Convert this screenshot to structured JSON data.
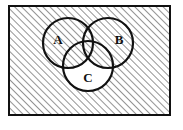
{
  "figure": {
    "kind": "venn-diagram",
    "title": "",
    "set_count": 3,
    "shading_description": "universal-set-and-intersections-hatched",
    "colors": {
      "page_background": "#ffffff",
      "frame_stroke": "#111111",
      "circle_stroke": "#111111",
      "hatch_stroke": "#3a3a3a",
      "label_text": "#111111",
      "circle_fill": "#ffffff"
    }
  },
  "frame": {
    "name": "universal-set-rectangle",
    "x": 9,
    "y": 6,
    "width": 161,
    "height": 109,
    "stroke_width": 2,
    "hatched": true
  },
  "hatch": {
    "angle_degrees": 45,
    "spacing_px": 5,
    "stroke_width": 1.1
  },
  "sets": [
    {
      "id": "A",
      "label": "A",
      "cx": 68,
      "cy": 43,
      "r": 25,
      "label_x": 58,
      "label_y": 41,
      "shaded": false
    },
    {
      "id": "B",
      "label": "B",
      "cx": 108,
      "cy": 43,
      "r": 25,
      "label_x": 119,
      "label_y": 41,
      "shaded": false
    },
    {
      "id": "C",
      "label": "C",
      "cx": 88,
      "cy": 66,
      "r": 25,
      "label_x": 88,
      "label_y": 79,
      "shaded": false
    }
  ],
  "regions": [
    {
      "id": "outside-all",
      "expression": "U \\ (A ∪ B ∪ C)",
      "hatched": true
    },
    {
      "id": "A-only",
      "expression": "A \\ (B ∪ C)",
      "hatched": false
    },
    {
      "id": "B-only",
      "expression": "B \\ (A ∪ C)",
      "hatched": false
    },
    {
      "id": "C-only",
      "expression": "C \\ (A ∪ B)",
      "hatched": false
    },
    {
      "id": "A-and-B",
      "expression": "A ∩ B",
      "hatched": true
    },
    {
      "id": "A-and-C",
      "expression": "A ∩ C",
      "hatched": true
    },
    {
      "id": "B-and-C",
      "expression": "B ∩ C",
      "hatched": true
    },
    {
      "id": "A-and-B-and-C",
      "expression": "A ∩ B ∩ C",
      "hatched": true
    }
  ]
}
